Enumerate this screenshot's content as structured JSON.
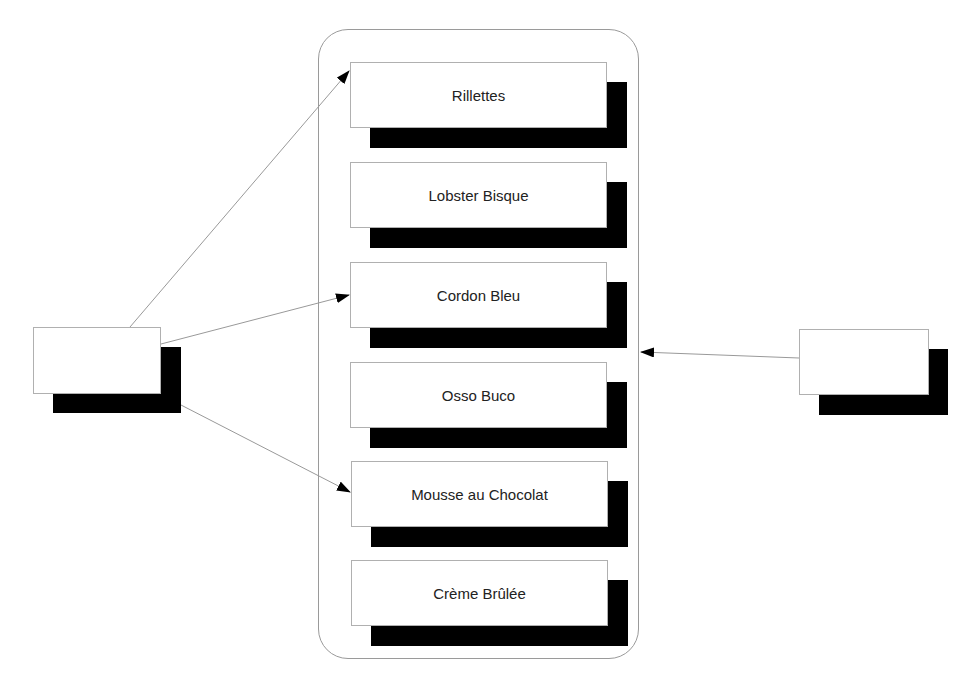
{
  "diagram": {
    "container": {
      "label": ""
    },
    "menu_items": [
      {
        "label": "Rillettes"
      },
      {
        "label": "Lobster Bisque"
      },
      {
        "label": "Cordon Bleu"
      },
      {
        "label": "Osso Buco"
      },
      {
        "label": "Mousse au Chocolat"
      },
      {
        "label": "Crème Brûlée"
      }
    ],
    "left_node": {
      "label": ""
    },
    "right_node": {
      "label": ""
    },
    "edges": [
      {
        "from": "left_node",
        "to": "Rillettes"
      },
      {
        "from": "left_node",
        "to": "Cordon Bleu"
      },
      {
        "from": "left_node",
        "to": "Mousse au Chocolat"
      },
      {
        "from": "right_node",
        "to": "container"
      }
    ],
    "colors": {
      "shadow": "#000000",
      "border": "#b0b0b0",
      "edge": "#999999",
      "text": "#222222"
    }
  }
}
